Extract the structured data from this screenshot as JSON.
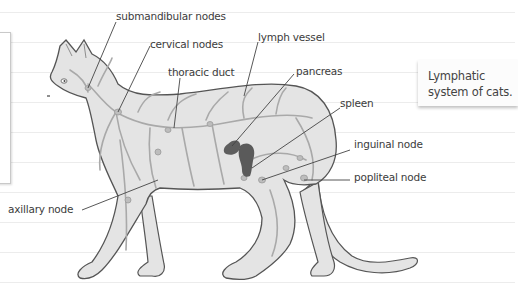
{
  "diagram": {
    "title": "Lymphatic system of cats.",
    "note": {
      "line1": "Lymphatic",
      "line2": "system of cats."
    },
    "labels": [
      {
        "id": "submandibular-nodes",
        "text": "submandibular nodes"
      },
      {
        "id": "cervical-nodes",
        "text": "cervical nodes"
      },
      {
        "id": "lymph-vessel",
        "text": "lymph vessel"
      },
      {
        "id": "thoracic-duct",
        "text": "thoracic duct"
      },
      {
        "id": "pancreas",
        "text": "pancreas"
      },
      {
        "id": "spleen",
        "text": "spleen"
      },
      {
        "id": "inguinal-node",
        "text": "inguinal node"
      },
      {
        "id": "popliteal-node",
        "text": "popliteal node"
      },
      {
        "id": "axillary-node",
        "text": "axillary node"
      }
    ],
    "colors": {
      "body_fill": "#e4e4e4",
      "outline": "#555555",
      "vessel": "#a9a9a9",
      "organ": "#5e5e5e",
      "leader": "#444444",
      "ruled_line": "#ececec"
    }
  }
}
